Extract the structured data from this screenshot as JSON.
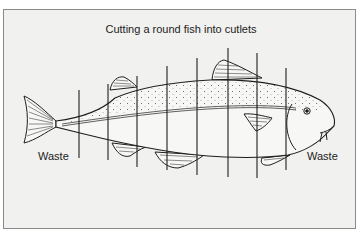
{
  "diagram": {
    "title": "Cutting a round fish into cutlets",
    "labels": {
      "waste_left": "Waste",
      "waste_right": "Waste"
    },
    "cut_lines": [
      {
        "x": 79,
        "y1": 90,
        "y2": 158
      },
      {
        "x": 108,
        "y1": 84,
        "y2": 160
      },
      {
        "x": 137,
        "y1": 76,
        "y2": 167
      },
      {
        "x": 167,
        "y1": 66,
        "y2": 170
      },
      {
        "x": 197,
        "y1": 58,
        "y2": 175
      },
      {
        "x": 228,
        "y1": 48,
        "y2": 177
      },
      {
        "x": 257,
        "y1": 53,
        "y2": 178
      },
      {
        "x": 286,
        "y1": 68,
        "y2": 170
      }
    ],
    "colors": {
      "background": "#f1f1ef",
      "border": "#8a8a8a",
      "ink": "#1e1e1e"
    }
  }
}
